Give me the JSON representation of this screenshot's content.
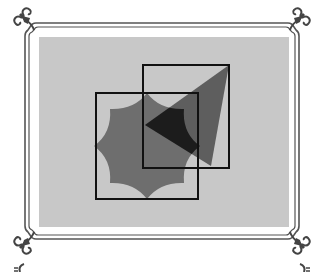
{
  "figure": {
    "colors": {
      "page_background": "#ffffff",
      "frame_line": "#555555",
      "canvas_fill": "#c8c8c8",
      "star_fill": "#6e6e6e",
      "triangle_fill": "#5e5e5e",
      "overlap_fill": "#1c1c1c",
      "square_stroke": "#111111",
      "ornament": "#444444"
    },
    "canvas_rect": {
      "x": 39,
      "y": 37,
      "w": 250,
      "h": 190
    },
    "square_left": {
      "x": 96,
      "y": 93,
      "w": 102,
      "h": 106
    },
    "square_right": {
      "x": 143,
      "y": 65,
      "w": 86,
      "h": 103
    },
    "star": {
      "cx": 147,
      "cy": 146,
      "r_outer": 53,
      "points": 8
    },
    "triangle": {
      "points": "145,125 229,65 211,166"
    },
    "ornaments": [
      "corner-top-left",
      "corner-top-right",
      "corner-bottom-left",
      "corner-bottom-right"
    ]
  }
}
